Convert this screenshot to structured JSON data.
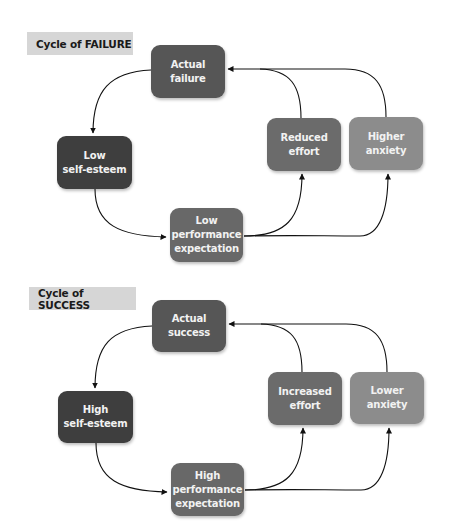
{
  "colors": {
    "self_esteem": "#3e3e3e",
    "actual_outcome": "#565656",
    "expectation": "#686868",
    "effort": "#6b6b6b",
    "anxiety": "#8c8c8c",
    "title_bg": "#d6d6d6",
    "arrow": "#111111"
  },
  "failure": {
    "title": "Cycle of FAILURE",
    "actual": [
      "Actual",
      "failure"
    ],
    "self_esteem": [
      "Low",
      "self-esteem"
    ],
    "expectation": [
      "Low",
      "performance",
      "expectation"
    ],
    "effort": [
      "Reduced",
      "effort"
    ],
    "anxiety": [
      "Higher",
      "anxiety"
    ]
  },
  "success": {
    "title": "Cycle of SUCCESS",
    "actual": [
      "Actual",
      "success"
    ],
    "self_esteem": [
      "High",
      "self-esteem"
    ],
    "expectation": [
      "High",
      "performance",
      "expectation"
    ],
    "effort": [
      "Increased",
      "effort"
    ],
    "anxiety": [
      "Lower",
      "anxiety"
    ]
  }
}
